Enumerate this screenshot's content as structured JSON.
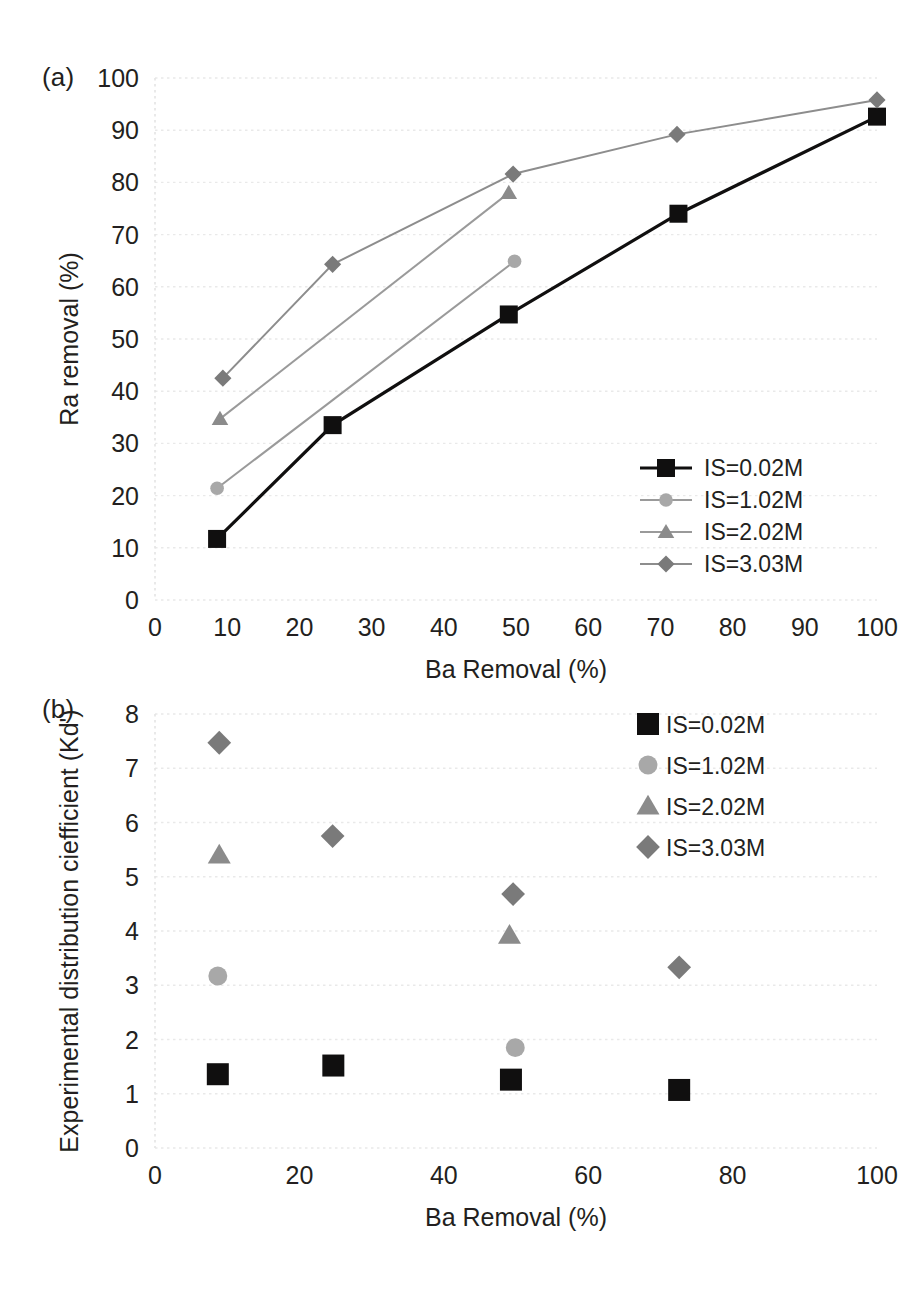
{
  "figure": {
    "panel_a_label": "(a)",
    "panel_b_label": "(b)",
    "series_colors": {
      "IS=0.02M": "#100f0f",
      "IS=1.02M": "#a8a8a8",
      "IS=2.02M": "#8b8b8b",
      "IS=3.03M": "#7a7a7a",
      "line_gray": "#8d8d8d",
      "grid": "#e9e9e9"
    }
  },
  "chart_data": [
    {
      "type": "line",
      "panel": "(a)",
      "title": "",
      "xlabel": "Ba Removal (%)",
      "ylabel": "Ra removal (%)",
      "xlim": [
        0,
        100
      ],
      "ylim": [
        0,
        100
      ],
      "xticks": [
        0,
        10,
        20,
        30,
        40,
        50,
        60,
        70,
        80,
        90,
        100
      ],
      "yticks": [
        0,
        10,
        20,
        30,
        40,
        50,
        60,
        70,
        80,
        90,
        100
      ],
      "grid": true,
      "legend_position": "right-inside-lower",
      "series": [
        {
          "name": "IS=0.02M",
          "marker": "square",
          "color": "#100f0f",
          "line_color": "#100f0f",
          "x": [
            8.6,
            24.6,
            49.0,
            72.5,
            100.0
          ],
          "y": [
            11.7,
            33.5,
            54.7,
            74.0,
            92.6
          ]
        },
        {
          "name": "IS=1.02M",
          "marker": "circle",
          "color": "#a8a8a8",
          "line_color": "#9a9a9a",
          "x": [
            8.6,
            49.8
          ],
          "y": [
            21.4,
            64.9
          ]
        },
        {
          "name": "IS=2.02M",
          "marker": "triangle",
          "color": "#8b8b8b",
          "line_color": "#9a9a9a",
          "x": [
            9.0,
            49.0
          ],
          "y": [
            34.7,
            78.0
          ]
        },
        {
          "name": "IS=3.03M",
          "marker": "diamond",
          "color": "#7a7a7a",
          "line_color": "#8d8d8d",
          "x": [
            9.4,
            24.6,
            49.6,
            72.3,
            100.0
          ],
          "y": [
            42.5,
            64.3,
            81.6,
            89.2,
            95.8
          ]
        }
      ]
    },
    {
      "type": "scatter",
      "panel": "(b)",
      "title": "",
      "xlabel": "Ba Removal (%)",
      "ylabel": "Experimental distribution ciefficient (Kd')",
      "xlim": [
        0,
        100
      ],
      "ylim": [
        0,
        8
      ],
      "xticks": [
        0,
        20,
        40,
        60,
        80,
        100
      ],
      "yticks": [
        0,
        1,
        2,
        3,
        4,
        5,
        6,
        7,
        8
      ],
      "grid": true,
      "legend_position": "top-right",
      "series": [
        {
          "name": "IS=0.02M",
          "marker": "square",
          "color": "#100f0f",
          "x": [
            8.7,
            24.7,
            49.3,
            72.6
          ],
          "y": [
            1.36,
            1.52,
            1.26,
            1.07
          ]
        },
        {
          "name": "IS=1.02M",
          "marker": "circle",
          "color": "#a8a8a8",
          "x": [
            8.7,
            49.9
          ],
          "y": [
            3.17,
            1.85
          ]
        },
        {
          "name": "IS=2.02M",
          "marker": "triangle",
          "color": "#8b8b8b",
          "x": [
            8.9,
            49.1
          ],
          "y": [
            5.4,
            3.92
          ]
        },
        {
          "name": "IS=3.03M",
          "marker": "diamond",
          "color": "#7a7a7a",
          "x": [
            8.9,
            24.6,
            49.6,
            72.6
          ],
          "y": [
            7.47,
            5.75,
            4.68,
            3.33
          ]
        }
      ]
    }
  ]
}
